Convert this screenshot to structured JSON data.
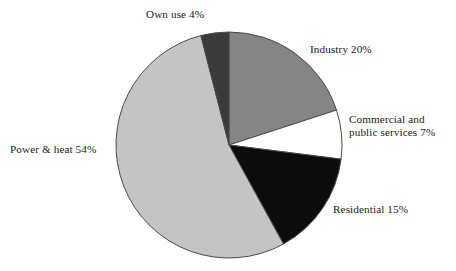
{
  "chart_data": {
    "type": "pie",
    "title": "",
    "subtitle": "",
    "xlabel": "",
    "ylabel": "",
    "legend_position": "none",
    "grid": false,
    "start_angle_deg": 0,
    "direction": "clockwise",
    "categories": [
      "Industry",
      "Commercial and public services",
      "Residential",
      "Power & heat",
      "Own use"
    ],
    "values": [
      20,
      7,
      15,
      54,
      4
    ],
    "unit": "%",
    "total": 100,
    "slices": [
      {
        "name": "Industry",
        "value": 20,
        "label": "Industry 20%",
        "color": "#858585",
        "start_deg": 0,
        "end_deg": 72
      },
      {
        "name": "Commercial and public services",
        "value": 7,
        "label_line1": "Commercial and",
        "label_line2": "public services 7%",
        "color": "#ffffff",
        "start_deg": 72,
        "end_deg": 97.2
      },
      {
        "name": "Residential",
        "value": 15,
        "label": "Residential 15%",
        "color": "#0c0c0c",
        "start_deg": 97.2,
        "end_deg": 151.2
      },
      {
        "name": "Power & heat",
        "value": 54,
        "label": "Power & heat 54%",
        "color": "#c4c4c4",
        "start_deg": 151.2,
        "end_deg": 345.6
      },
      {
        "name": "Own use",
        "value": 4,
        "label": "Own use 4%",
        "color": "#3a3a3a",
        "start_deg": 345.6,
        "end_deg": 360
      }
    ],
    "colors": {
      "industry": "#858585",
      "commercial": "#ffffff",
      "residential": "#0c0c0c",
      "power_heat": "#c4c4c4",
      "own_use": "#3a3a3a",
      "outline": "#4a4a4a",
      "background": "#ffffff",
      "text": "#1a1a1a"
    },
    "geometry": {
      "center_x": 229,
      "center_y": 145,
      "radius": 113
    }
  }
}
